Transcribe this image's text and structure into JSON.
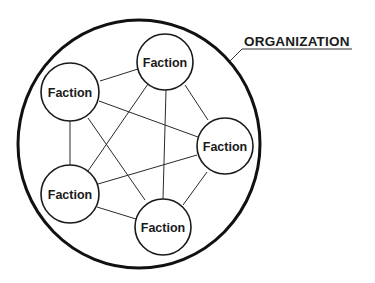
{
  "diagram": {
    "title": "ORGANIZATION",
    "container": {
      "label": "ORGANIZATION",
      "shape": "circle",
      "cx": 139,
      "cy": 144,
      "rx": 121,
      "ry": 124
    },
    "nodes": [
      {
        "id": "top",
        "label": "Faction",
        "cx": 165,
        "cy": 62,
        "r": 28
      },
      {
        "id": "top-left",
        "label": "Faction",
        "cx": 70,
        "cy": 92,
        "r": 29
      },
      {
        "id": "right",
        "label": "Faction",
        "cx": 225,
        "cy": 146,
        "r": 28
      },
      {
        "id": "bottom-left",
        "label": "Faction",
        "cx": 70,
        "cy": 194,
        "r": 29
      },
      {
        "id": "bottom",
        "label": "Faction",
        "cx": 163,
        "cy": 227,
        "r": 28
      }
    ],
    "edges": [
      {
        "from": "top-left",
        "to": "top"
      },
      {
        "from": "top-left",
        "to": "right"
      },
      {
        "from": "top-left",
        "to": "bottom-left"
      },
      {
        "from": "top-left",
        "to": "bottom"
      },
      {
        "from": "top",
        "to": "bottom-left"
      },
      {
        "from": "top",
        "to": "bottom"
      },
      {
        "from": "top",
        "to": "right"
      },
      {
        "from": "right",
        "to": "bottom-left"
      },
      {
        "from": "right",
        "to": "bottom"
      },
      {
        "from": "bottom-left",
        "to": "bottom"
      }
    ],
    "colors": {
      "stroke": "#1a1a1a",
      "background": "#ffffff"
    }
  }
}
